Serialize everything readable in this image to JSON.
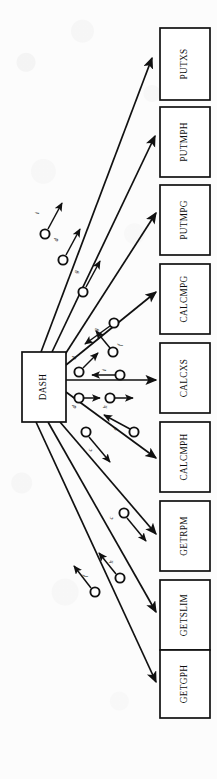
{
  "diagram": {
    "orientation": "rotated-90",
    "colors": {
      "line": "#111111",
      "box_fill": "#ffffff",
      "background": "#fcfcfc",
      "text": "#0d0d0d"
    },
    "center_node": {
      "id": "dash",
      "label": "DASH",
      "x": 22,
      "y": 352,
      "w": 44,
      "h": 70
    },
    "nodes": [
      {
        "id": "putxs",
        "label": "PUTXS",
        "x": 160,
        "y": 28,
        "w": 50,
        "h": 72
      },
      {
        "id": "putmph",
        "label": "PUTMPH",
        "x": 160,
        "y": 107,
        "w": 50,
        "h": 70
      },
      {
        "id": "putmpg",
        "label": "PUTMPG",
        "x": 160,
        "y": 185,
        "w": 50,
        "h": 70
      },
      {
        "id": "calcmpg",
        "label": "CALCMPG",
        "x": 160,
        "y": 264,
        "w": 50,
        "h": 70
      },
      {
        "id": "calcxs",
        "label": "CALCXS",
        "x": 160,
        "y": 343,
        "w": 50,
        "h": 70
      },
      {
        "id": "calcmph",
        "label": "CALCMPH",
        "x": 160,
        "y": 422,
        "w": 50,
        "h": 70
      },
      {
        "id": "getrpm",
        "label": "GETRPM",
        "x": 160,
        "y": 501,
        "w": 50,
        "h": 70
      },
      {
        "id": "getslim",
        "label": "GETSLIM",
        "x": 160,
        "y": 580,
        "w": 50,
        "h": 70
      },
      {
        "id": "getgph",
        "label": "GETGPH",
        "x": 160,
        "y": 650,
        "w": 50,
        "h": 68
      }
    ],
    "data_couples": [
      {
        "id": "couple-i",
        "label": "i",
        "cx": 47,
        "cy": 232,
        "direction": "out"
      },
      {
        "id": "couple-d1",
        "label": "d",
        "cx": 64,
        "cy": 259,
        "direction": "out"
      },
      {
        "id": "couple-g1",
        "label": "g",
        "cx": 83,
        "cy": 291,
        "direction": "out"
      },
      {
        "id": "couple-g2",
        "label": "g",
        "cx": 113,
        "cy": 323,
        "direction": "in"
      },
      {
        "id": "couple-f1",
        "label": "f",
        "cx": 113,
        "cy": 351,
        "direction": "out"
      },
      {
        "id": "couple-d2",
        "label": "d",
        "cx": 79,
        "cy": 372,
        "direction": "out"
      },
      {
        "id": "couple-i2",
        "label": "i",
        "cx": 120,
        "cy": 375,
        "direction": "in"
      },
      {
        "id": "couple-d3",
        "label": "d",
        "cx": 79,
        "cy": 398,
        "direction": "out"
      },
      {
        "id": "couple-h1",
        "label": "h",
        "cx": 110,
        "cy": 398,
        "direction": "out"
      },
      {
        "id": "couple-d4",
        "label": "d",
        "cx": 134,
        "cy": 432,
        "direction": "in"
      },
      {
        "id": "couple-c1",
        "label": "c",
        "cx": 86,
        "cy": 432,
        "direction": "out"
      },
      {
        "id": "couple-c2",
        "label": "c",
        "cx": 124,
        "cy": 513,
        "direction": "in"
      },
      {
        "id": "couple-h2",
        "label": "h",
        "cx": 120,
        "cy": 578,
        "direction": "out"
      },
      {
        "id": "couple-f2",
        "label": "f",
        "cx": 95,
        "cy": 592,
        "direction": "out"
      }
    ],
    "edges": [
      {
        "from": "dash",
        "to": "putxs",
        "arrow": "to-node"
      },
      {
        "from": "dash",
        "to": "putmph",
        "arrow": "to-node"
      },
      {
        "from": "dash",
        "to": "putmpg",
        "arrow": "to-node"
      },
      {
        "from": "dash",
        "to": "calcmpg",
        "arrow": "to-node"
      },
      {
        "from": "dash",
        "to": "calcxs",
        "arrow": "to-node"
      },
      {
        "from": "dash",
        "to": "calcmph",
        "arrow": "to-node"
      },
      {
        "from": "dash",
        "to": "getrpm",
        "arrow": "to-node"
      },
      {
        "from": "dash",
        "to": "getslim",
        "arrow": "to-node"
      },
      {
        "from": "dash",
        "to": "getgph",
        "arrow": "to-node"
      }
    ]
  }
}
